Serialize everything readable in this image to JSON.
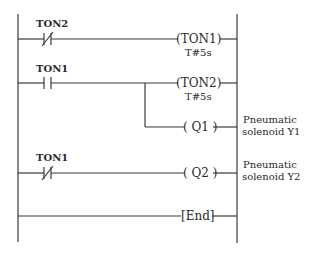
{
  "diagram": {
    "type": "ladder-logic",
    "rungs": [
      {
        "contact": {
          "label": "TON2",
          "type": "normally-closed"
        },
        "coil": {
          "text": "(TON1)",
          "preset": "T#5s"
        }
      },
      {
        "contact": {
          "label": "TON1",
          "type": "normally-open"
        },
        "coil": {
          "text": "(TON2)",
          "preset": "T#5s"
        },
        "branch": {
          "coil": {
            "text": "( Q1 )"
          },
          "note_line1": "Pneumatic",
          "note_line2": "solenoid Y1"
        }
      },
      {
        "contact": {
          "label": "TON1",
          "type": "normally-closed"
        },
        "coil": {
          "text": "( Q2 )"
        },
        "note_line1": "Pneumatic",
        "note_line2": "solenoid Y2"
      },
      {
        "end": {
          "text": "[End]"
        }
      }
    ]
  }
}
